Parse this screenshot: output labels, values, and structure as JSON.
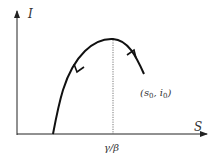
{
  "diagram": {
    "y_axis_label": "I",
    "x_axis_label": "S",
    "peak_label": "γ/β",
    "start_point_label": "(s",
    "start_point_sub_s": "0",
    "start_point_mid": ", i",
    "start_point_sub_i": "0",
    "start_point_close": ")"
  }
}
